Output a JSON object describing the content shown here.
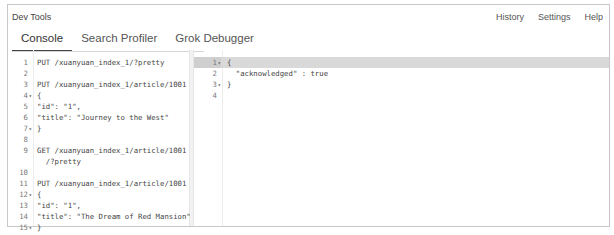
{
  "app": {
    "title": "Dev Tools",
    "links": [
      "History",
      "Settings",
      "Help"
    ]
  },
  "tabs": [
    {
      "label": "Console",
      "active": true
    },
    {
      "label": "Search Profiler",
      "active": false
    },
    {
      "label": "Grok Debugger",
      "active": false
    }
  ],
  "request_editor": {
    "lines": [
      {
        "n": "1",
        "code": "PUT /xuanyuan_index_1/?pretty"
      },
      {
        "n": "2",
        "code": ""
      },
      {
        "n": "3",
        "code": "PUT /xuanyuan_index_1/article/1001"
      },
      {
        "n": "4",
        "code": "{",
        "fold": true
      },
      {
        "n": "5",
        "code": "\"id\": \"1\","
      },
      {
        "n": "6",
        "code": "\"title\": \"Journey to the West\""
      },
      {
        "n": "7",
        "code": "}",
        "fold": true
      },
      {
        "n": "8",
        "code": ""
      },
      {
        "n": "9",
        "code": "GET /xuanyuan_index_1/article/1001"
      },
      {
        "n": "",
        "code": "  /?pretty"
      },
      {
        "n": "10",
        "code": ""
      },
      {
        "n": "11",
        "code": "PUT /xuanyuan_index_1/article/1001"
      },
      {
        "n": "12",
        "code": "{",
        "fold": true
      },
      {
        "n": "13",
        "code": "\"id\": \"1\","
      },
      {
        "n": "14",
        "code": "\"title\": \"The Dream of Red Mansion\""
      },
      {
        "n": "15",
        "code": "}",
        "fold": true
      },
      {
        "n": "16",
        "code": ""
      },
      {
        "n": "17",
        "code": "DELETE  /xuanyuan_index_1/article/1001"
      },
      {
        "n": "18",
        "code": ""
      },
      {
        "n": "19",
        "code": "DELETE  /xuanyuan_index_1?pretty",
        "highlighted": true
      }
    ],
    "actions": {
      "play": "play-icon",
      "settings": "wrench-icon"
    }
  },
  "response_editor": {
    "lines": [
      {
        "n": "1",
        "code": "{",
        "fold": true,
        "highlighted": true
      },
      {
        "n": "2",
        "code": "  \"acknowledged\" : true"
      },
      {
        "n": "3",
        "code": "}",
        "fold": true
      },
      {
        "n": "4",
        "code": ""
      }
    ]
  }
}
